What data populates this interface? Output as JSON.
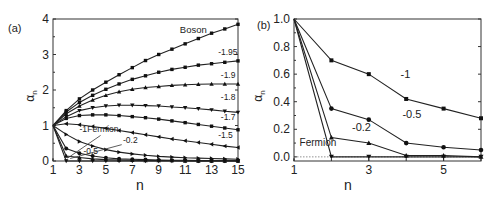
{
  "figure": {
    "panels": [
      "(a)",
      "(b)"
    ]
  },
  "chart_data": [
    {
      "type": "line",
      "panel_label": "(a)",
      "title": "",
      "xlabel": "n",
      "ylabel": "α_n",
      "xlim": [
        1,
        15
      ],
      "ylim": [
        0,
        4
      ],
      "xticks": [
        1,
        3,
        5,
        7,
        9,
        11,
        13,
        15
      ],
      "yticks": [
        0,
        1,
        2,
        3,
        4
      ],
      "grid": false,
      "legend": "inline labels",
      "x": [
        1,
        2,
        3,
        4,
        5,
        6,
        7,
        8,
        9,
        10,
        11,
        12,
        13,
        14,
        15
      ],
      "series": [
        {
          "name": "Boson",
          "marker": "square",
          "values": [
            1.0,
            1.42,
            1.75,
            2.0,
            2.22,
            2.43,
            2.63,
            2.83,
            3.0,
            3.15,
            3.3,
            3.45,
            3.6,
            3.72,
            3.85
          ],
          "label_pos": [
            10.6,
            3.6
          ]
        },
        {
          "name": "-1.95",
          "marker": "square",
          "values": [
            1.0,
            1.38,
            1.65,
            1.85,
            2.02,
            2.17,
            2.3,
            2.4,
            2.5,
            2.58,
            2.64,
            2.7,
            2.74,
            2.78,
            2.82
          ],
          "label_pos": [
            13.5,
            3.0
          ]
        },
        {
          "name": "-1.9",
          "marker": "triangle-up",
          "values": [
            1.0,
            1.33,
            1.55,
            1.72,
            1.85,
            1.95,
            2.02,
            2.07,
            2.1,
            2.13,
            2.15,
            2.16,
            2.17,
            2.17,
            2.17
          ],
          "label_pos": [
            13.7,
            2.35
          ]
        },
        {
          "name": "-1.8",
          "marker": "triangle-down",
          "values": [
            1.0,
            1.25,
            1.42,
            1.5,
            1.55,
            1.57,
            1.57,
            1.56,
            1.55,
            1.52,
            1.5,
            1.47,
            1.44,
            1.4,
            1.37
          ],
          "label_pos": [
            13.7,
            1.72
          ]
        },
        {
          "name": "-1.7",
          "marker": "square",
          "values": [
            1.0,
            1.2,
            1.28,
            1.3,
            1.3,
            1.28,
            1.25,
            1.22,
            1.18,
            1.13,
            1.08,
            1.03,
            0.98,
            0.93,
            0.88
          ],
          "label_pos": [
            13.7,
            1.15
          ]
        },
        {
          "name": "-1.5",
          "marker": "triangle-left",
          "values": [
            1.0,
            1.05,
            1.02,
            0.97,
            0.92,
            0.86,
            0.8,
            0.74,
            0.68,
            0.62,
            0.57,
            0.52,
            0.47,
            0.42,
            0.38
          ],
          "label_pos": [
            13.5,
            0.65
          ]
        },
        {
          "name": "-1",
          "marker": "triangle-right",
          "values": [
            1.0,
            0.75,
            0.55,
            0.42,
            0.32,
            0.25,
            0.2,
            0.16,
            0.13,
            0.11,
            0.09,
            0.08,
            0.07,
            0.06,
            0.05
          ],
          "label_pos": [
            3.0,
            0.82
          ]
        },
        {
          "name": "-0.5",
          "marker": "circle",
          "values": [
            1.0,
            0.35,
            0.22,
            0.14,
            0.09,
            0.06,
            0.05,
            0.04,
            0.03,
            0.02,
            0.02,
            0.01,
            0.01,
            0.01,
            0.01
          ],
          "label_pos": [
            3.3,
            0.2
          ]
        },
        {
          "name": "-0.2",
          "marker": "triangle-up",
          "values": [
            1.0,
            0.14,
            0.1,
            0.06,
            0.04,
            0.03,
            0.02,
            0.01,
            0.01,
            0.01,
            0.0,
            0.0,
            0.0,
            0.0,
            0.0
          ],
          "label_pos": [
            6.3,
            0.5
          ]
        },
        {
          "name": "Fermion",
          "marker": "triangle-down",
          "values": [
            1.0,
            0.0,
            0.0,
            0.0,
            0.0,
            0.0,
            0.0,
            0.0,
            0.0,
            0.0,
            0.0,
            0.0,
            0.0,
            0.0,
            0.0
          ],
          "label_pos": [
            3.6,
            0.82
          ]
        }
      ],
      "annotations": [
        "Boson",
        "-1.95",
        "-1.9",
        "-1.8",
        "-1.7",
        "-1.5",
        "-1",
        "Fermion",
        "-0.2",
        "-0.5"
      ]
    },
    {
      "type": "line",
      "panel_label": "(b)",
      "title": "",
      "xlabel": "n",
      "ylabel": "α_n",
      "xlim": [
        1,
        6
      ],
      "ylim": [
        -0.03,
        1.0
      ],
      "xticks": [
        1,
        3,
        5
      ],
      "yticks": [
        0.0,
        0.2,
        0.4,
        0.6,
        0.8,
        1.0
      ],
      "grid": false,
      "reference_line": {
        "y": 0.0,
        "style": "dotted"
      },
      "legend": "inline labels",
      "x": [
        1,
        2,
        3,
        4,
        5,
        6
      ],
      "series": [
        {
          "name": "-1",
          "marker": "square",
          "values": [
            1.0,
            0.7,
            0.6,
            0.42,
            0.35,
            0.28
          ],
          "label_pos": [
            3.85,
            0.57
          ]
        },
        {
          "name": "-0.5",
          "marker": "circle",
          "values": [
            1.0,
            0.35,
            0.27,
            0.1,
            0.07,
            0.05
          ],
          "label_pos": [
            3.9,
            0.28
          ]
        },
        {
          "name": "-0.2",
          "marker": "triangle-up",
          "values": [
            1.0,
            0.14,
            0.1,
            0.01,
            0.01,
            0.0
          ],
          "label_pos": [
            2.55,
            0.19
          ]
        },
        {
          "name": "Fermion",
          "marker": "triangle-down",
          "values": [
            1.0,
            0.0,
            0.0,
            0.0,
            0.0,
            0.0
          ],
          "label_pos": [
            1.15,
            0.08
          ]
        }
      ],
      "annotations": [
        "-1",
        "-0.5",
        "-0.2",
        "Fermion"
      ]
    }
  ]
}
